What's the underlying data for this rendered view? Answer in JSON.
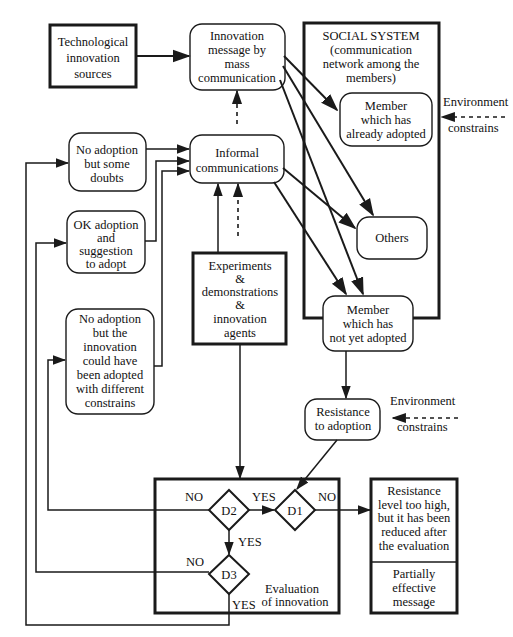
{
  "diagram": {
    "tech_sources": [
      "Technological",
      "innovation",
      "sources"
    ],
    "mass_comm": [
      "Innovation",
      "message by",
      "mass",
      "communication"
    ],
    "social_system": [
      "SOCIAL SYSTEM",
      "(communication",
      "network among the",
      "members)"
    ],
    "member_adopted": [
      "Member",
      "which has",
      "already adopted"
    ],
    "env_top": {
      "line1": "Environment",
      "line2": "constrains"
    },
    "no_adoption_doubts": [
      "No adoption",
      "but some",
      "doubts"
    ],
    "informal_comm": [
      "Informal",
      "communications"
    ],
    "ok_adoption": [
      "OK adoption",
      "and",
      "suggestion",
      "to adopt"
    ],
    "others": "Others",
    "experiments": [
      "Experiments",
      "&",
      "demonstrations",
      "&",
      "innovation",
      "agents"
    ],
    "no_adoption_constraints": [
      "No adoption",
      "but the",
      "innovation",
      "could have",
      "been adopted",
      "with different",
      "constrains"
    ],
    "member_not_adopted": [
      "Member",
      "which has",
      "not yet adopted"
    ],
    "resistance": [
      "Resistance",
      "to adoption"
    ],
    "env_bottom": {
      "line1": "Environment",
      "line2": "constrains"
    },
    "evaluation": {
      "label": [
        "Evaluation",
        "of innovation"
      ],
      "d1": "D1",
      "d2": "D2",
      "d3": "D3",
      "d2_no": "NO",
      "d2_yes": "YES",
      "d1_no": "NO",
      "d2_down_yes": "YES",
      "d3_no": "NO",
      "d3_yes": "YES"
    },
    "result_box": {
      "top": [
        "Resistance",
        "level too high,",
        "but it has been",
        "reduced after",
        "the evaluation"
      ],
      "bottom": [
        "Partially",
        "effective",
        "message"
      ]
    }
  }
}
